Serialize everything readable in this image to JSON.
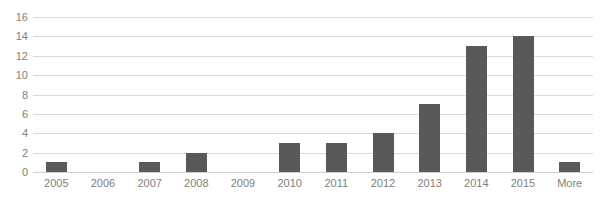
{
  "chart_data": {
    "type": "bar",
    "title": "",
    "subtitle": "",
    "xlabel": "",
    "ylabel": "",
    "categories": [
      "2005",
      "2006",
      "2007",
      "2008",
      "2009",
      "2010",
      "2011",
      "2012",
      "2013",
      "2014",
      "2015",
      "More"
    ],
    "values": [
      1,
      0,
      1,
      2,
      0,
      3,
      3,
      4,
      7,
      13,
      14,
      1
    ],
    "ylim": [
      0,
      16
    ],
    "y_ticks": [
      0,
      2,
      4,
      6,
      8,
      10,
      12,
      14,
      16
    ],
    "y_tick_labels": [
      "0",
      "2",
      "4",
      "6",
      "8",
      "10",
      "12",
      "14",
      "16"
    ],
    "grid": "horizontal",
    "legend": "none",
    "bar_color": "#595959",
    "gridline_color": "#D9D9D9",
    "axis_text_color": "#808080",
    "background_color": "#FFFFFF"
  }
}
